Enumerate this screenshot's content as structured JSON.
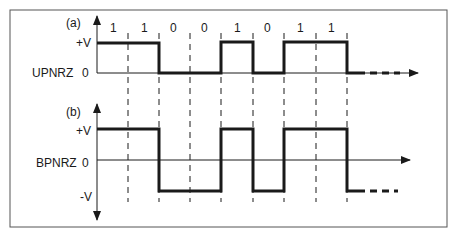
{
  "figure": {
    "panel_a": {
      "tag": "(a)",
      "name": "UPNRZ",
      "levels": {
        "high": "+V",
        "zero": "0"
      },
      "bits": [
        "1",
        "1",
        "0",
        "0",
        "1",
        "0",
        "1",
        "1"
      ]
    },
    "panel_b": {
      "tag": "(b)",
      "name": "BPNRZ",
      "levels": {
        "high": "+V",
        "zero": "0",
        "low": "-V"
      },
      "bits": [
        "1",
        "1",
        "0",
        "0",
        "1",
        "0",
        "1",
        "1"
      ]
    },
    "colors": {
      "ink": "#1a1a1a",
      "border": "#555555",
      "background": "#ffffff"
    }
  }
}
